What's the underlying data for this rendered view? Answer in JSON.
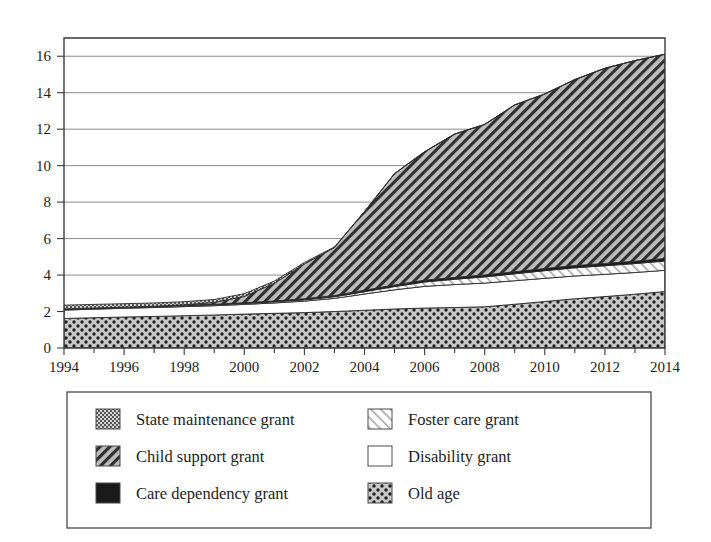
{
  "chart_data": {
    "type": "area",
    "stacked": true,
    "title": "",
    "subtitle": "",
    "xlabel": "",
    "ylabel": "",
    "xlim": [
      1994,
      2014
    ],
    "ylim": [
      0,
      17
    ],
    "yticks": [
      0,
      2,
      4,
      6,
      8,
      10,
      12,
      14,
      16
    ],
    "ytick_labels": [
      "0",
      "2",
      "4",
      "6",
      "8",
      "10",
      "12",
      "14",
      "16"
    ],
    "xticks": [
      1994,
      1996,
      1998,
      2000,
      2002,
      2004,
      2006,
      2008,
      2010,
      2012,
      2014
    ],
    "xtick_labels": [
      "1994",
      "1996",
      "1998",
      "2000",
      "2002",
      "2004",
      "2006",
      "2008",
      "2010",
      "2012",
      "2014"
    ],
    "x_minor_ticks": [
      1995,
      1997,
      1999,
      2001,
      2003,
      2005,
      2007,
      2009,
      2011,
      2013
    ],
    "grid": "horizontal",
    "legend_position": "below",
    "x": [
      1994,
      1995,
      1996,
      1997,
      1998,
      1999,
      2000,
      2001,
      2002,
      2003,
      2004,
      2005,
      2006,
      2007,
      2008,
      2009,
      2010,
      2011,
      2012,
      2013,
      2014
    ],
    "stack_order_bottom_to_top": [
      "Old age",
      "Disability grant",
      "Foster care grant",
      "Care dependency grant",
      "Child support grant",
      "State maintenance grant"
    ],
    "series": [
      {
        "name": "Old age",
        "pattern": "polka-dot",
        "values": [
          1.62,
          1.66,
          1.7,
          1.73,
          1.77,
          1.81,
          1.86,
          1.9,
          1.94,
          2.0,
          2.07,
          2.14,
          2.19,
          2.22,
          2.26,
          2.4,
          2.55,
          2.7,
          2.82,
          2.95,
          3.1
        ]
      },
      {
        "name": "Disability grant",
        "pattern": "solid-white",
        "values": [
          0.46,
          0.47,
          0.48,
          0.49,
          0.5,
          0.51,
          0.53,
          0.57,
          0.63,
          0.72,
          0.89,
          1.05,
          1.19,
          1.26,
          1.3,
          1.29,
          1.27,
          1.25,
          1.22,
          1.19,
          1.16
        ]
      },
      {
        "name": "Foster care grant",
        "pattern": "light-diagonal-hatch",
        "values": [
          0.04,
          0.04,
          0.04,
          0.04,
          0.05,
          0.05,
          0.05,
          0.06,
          0.07,
          0.09,
          0.13,
          0.18,
          0.24,
          0.29,
          0.34,
          0.38,
          0.42,
          0.45,
          0.47,
          0.49,
          0.51
        ]
      },
      {
        "name": "Care dependency grant",
        "pattern": "solid-black",
        "values": [
          0.02,
          0.02,
          0.02,
          0.03,
          0.03,
          0.03,
          0.04,
          0.05,
          0.06,
          0.07,
          0.08,
          0.09,
          0.1,
          0.1,
          0.11,
          0.11,
          0.12,
          0.12,
          0.13,
          0.13,
          0.14
        ]
      },
      {
        "name": "Child support grant",
        "pattern": "dark-diagonal-hatch",
        "values": [
          0.0,
          0.0,
          0.0,
          0.0,
          0.02,
          0.1,
          0.35,
          0.97,
          1.91,
          2.63,
          4.31,
          6.1,
          7.04,
          7.86,
          8.25,
          9.15,
          9.57,
          10.2,
          10.7,
          11.0,
          11.2
        ]
      },
      {
        "name": "State maintenance grant",
        "pattern": "fine-crosshatch",
        "values": [
          0.21,
          0.2,
          0.19,
          0.18,
          0.17,
          0.16,
          0.15,
          0.12,
          0.08,
          0.03,
          0.0,
          0.0,
          0.0,
          0.0,
          0.0,
          0.0,
          0.0,
          0.0,
          0.0,
          0.0,
          0.0
        ]
      }
    ],
    "totals": [
      2.35,
      2.39,
      2.43,
      2.47,
      2.54,
      2.66,
      2.98,
      3.67,
      4.69,
      5.54,
      7.48,
      9.56,
      10.76,
      11.73,
      12.26,
      13.33,
      13.93,
      14.72,
      15.34,
      15.76,
      16.11
    ]
  },
  "legend": {
    "items": [
      {
        "label": "State maintenance grant",
        "pattern": "fine-crosshatch",
        "column": 1,
        "row": 1
      },
      {
        "label": "Child support grant",
        "pattern": "dark-diagonal-hatch",
        "column": 1,
        "row": 2
      },
      {
        "label": "Care dependency grant",
        "pattern": "solid-black",
        "column": 1,
        "row": 3
      },
      {
        "label": "Foster care grant",
        "pattern": "light-diagonal-hatch",
        "column": 2,
        "row": 1
      },
      {
        "label": "Disability grant",
        "pattern": "solid-white",
        "column": 2,
        "row": 2
      },
      {
        "label": "Old age",
        "pattern": "polka-dot",
        "column": 2,
        "row": 3
      }
    ]
  },
  "colors": {
    "background": "#ffffff",
    "axis": "#3a3a3a",
    "grid": "#767676",
    "text": "#1d1d1d",
    "hatch_dark": "#2b2b2b",
    "hatch_light": "#9a9a9a",
    "fill_gray": "#b4b4b4",
    "solid_black": "#1a1a1a"
  }
}
